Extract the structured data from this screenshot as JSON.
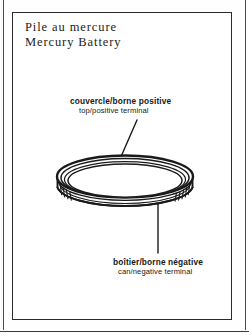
{
  "figure": {
    "title_fr": "Pile au mercure",
    "title_en": "Mercury Battery",
    "callouts": [
      {
        "id": "top-positive-terminal",
        "fr": "couvercle/borne  positive",
        "en": "top/positive  terminal",
        "leader": "diagonal"
      },
      {
        "id": "can-negative-terminal",
        "fr": "boîtier/borne  négative",
        "en": "can/negative  terminal",
        "leader": "vertical"
      }
    ],
    "illustration": {
      "subject": "mercury-coin-cell-battery",
      "view": "three-quarter perspective disc",
      "ink_color": "#1a1a1a",
      "fill_color": "#ffffff"
    },
    "frame_color": "#2b2b2b",
    "background_color": "#ffffff"
  }
}
